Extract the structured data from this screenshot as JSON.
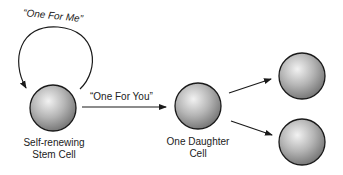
{
  "diagram": {
    "loop_label": "“One For Me”",
    "arrow_label": "“One For You”",
    "stem_cell_label_line1": "Self-renewing",
    "stem_cell_label_line2": "Stem Cell",
    "daughter_label_line1": "One Daughter",
    "daughter_label_line2": "Cell",
    "colors": {
      "cell_fill_light": "#e8e8e8",
      "cell_fill_dark": "#8a8a8a",
      "outline": "#1a1a1a"
    }
  }
}
